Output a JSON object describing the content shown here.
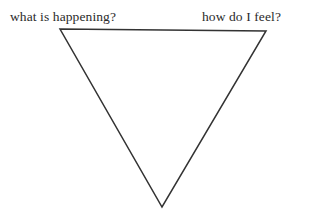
{
  "canvas": {
    "width": 317,
    "height": 213,
    "background_color": "#ffffff"
  },
  "labels": {
    "left": "what is happening?",
    "right": "how do I feel?"
  },
  "diagram": {
    "shape_name": "inverted-triangle",
    "stroke_color": "#333333",
    "stroke_width": 1.5,
    "fill_color": "none",
    "vertices": {
      "top_left": {
        "x": 60,
        "y": 29
      },
      "top_right": {
        "x": 266,
        "y": 31
      },
      "bottom": {
        "x": 162,
        "y": 207
      }
    },
    "points_attr": "60,29 266,31 162,207"
  }
}
